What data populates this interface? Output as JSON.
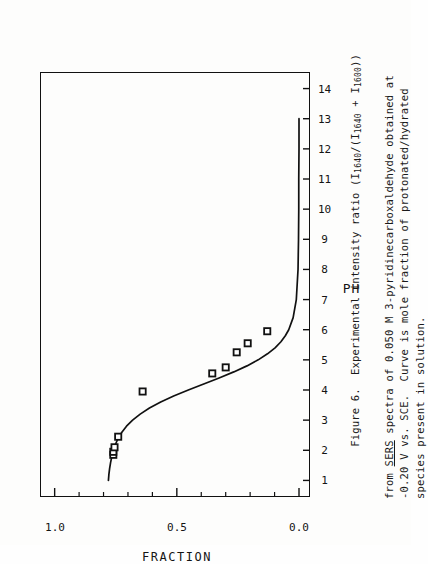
{
  "figure": {
    "label": "Figure 6.",
    "caption_lines": [
      "Figure 6.  Experimental intensity ratio (I1640/(I1640 + I1600))",
      "from SERS spectra of 0.050 M 3-pyridinecarboxaldehyde obtained at",
      "-0.20 V vs. SCE.  Curve is mole fraction of protonated/hydrated",
      "species present in solution."
    ],
    "caption_full": "Figure 6.  Experimental intensity ratio (I1640/(I1640 + I1600)) from SERS spectra of 0.050 M 3-pyridinecarboxaldehyde obtained at -0.20 V vs. SCE.  Curve is mole fraction of protonated/hydrated species present in solution."
  },
  "chart_data": {
    "type": "scatter",
    "title": "",
    "xlabel": "PH",
    "ylabel": "FRACTION",
    "xlim": [
      0.45,
      14.55
    ],
    "ylim": [
      -0.045,
      1.06
    ],
    "xticks": [
      1,
      2,
      3,
      4,
      5,
      6,
      7,
      8,
      9,
      10,
      11,
      12,
      13,
      14
    ],
    "xticklabels": [
      "1",
      "2",
      "3",
      "4",
      "5",
      "6",
      "7",
      "8",
      "9",
      "10",
      "11",
      "12",
      "13",
      "14"
    ],
    "yticks": [
      0.0,
      0.5,
      1.0
    ],
    "yticklabels": [
      "0.0",
      "0.5",
      "1.0"
    ],
    "minor_yticks": [
      0.1,
      0.2,
      0.3,
      0.4,
      0.6,
      0.7,
      0.8,
      0.9
    ],
    "grid": false,
    "legend": null,
    "series": [
      {
        "name": "Curve (mole fraction protonated/hydrated)",
        "type": "line",
        "marker": "none",
        "x": [
          1.0,
          1.2,
          1.4,
          1.6,
          1.8,
          2.0,
          2.2,
          2.4,
          2.6,
          2.8,
          3.0,
          3.2,
          3.4,
          3.6,
          3.8,
          4.0,
          4.2,
          4.4,
          4.6,
          4.8,
          5.0,
          5.2,
          5.4,
          5.6,
          5.8,
          6.0,
          6.4,
          7.0,
          8.0,
          9.0,
          10.0,
          11.0,
          12.0,
          13.0
        ],
        "y": [
          0.78,
          0.778,
          0.775,
          0.771,
          0.766,
          0.76,
          0.751,
          0.74,
          0.725,
          0.706,
          0.681,
          0.65,
          0.612,
          0.566,
          0.513,
          0.453,
          0.39,
          0.327,
          0.267,
          0.213,
          0.167,
          0.129,
          0.098,
          0.074,
          0.056,
          0.042,
          0.024,
          0.011,
          0.004,
          0.002,
          0.001,
          0.001,
          0.0,
          0.0
        ]
      },
      {
        "name": "Experimental intensity ratio",
        "type": "scatter",
        "marker": "open-square",
        "x": [
          1.85,
          1.95,
          2.1,
          2.45,
          3.95,
          4.55,
          4.75,
          5.25,
          5.55,
          5.95
        ],
        "y": [
          0.76,
          0.76,
          0.755,
          0.74,
          0.64,
          0.355,
          0.3,
          0.255,
          0.21,
          0.13
        ]
      }
    ]
  },
  "axis": {
    "x_title": "PH",
    "y_title": "FRACTION"
  }
}
